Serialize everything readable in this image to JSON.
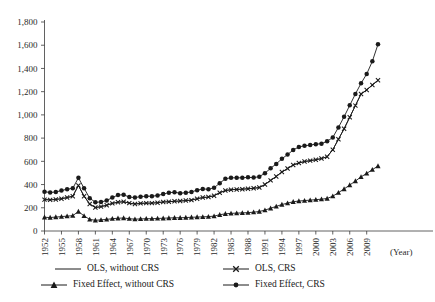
{
  "chart_data": {
    "type": "line",
    "title": "",
    "xlabel": "(Year)",
    "ylabel": "",
    "ylim": [
      0,
      1800
    ],
    "ytick_step": 200,
    "grid": false,
    "legend_position": "bottom",
    "xlabel_suffix": "(Year)",
    "ytick_labels": [
      "0",
      "200",
      "400",
      "600",
      "800",
      "1,000",
      "1,200",
      "1,400",
      "1,600",
      "1,800"
    ],
    "ytick_values": [
      0,
      200,
      400,
      600,
      800,
      1000,
      1200,
      1400,
      1600,
      1800
    ],
    "xtick_labels": [
      "1952",
      "1955",
      "1958",
      "1961",
      "1964",
      "1967",
      "1970",
      "1973",
      "1976",
      "1979",
      "1982",
      "1985",
      "1988",
      "1991",
      "1994",
      "1997",
      "2000",
      "2003",
      "2006",
      "2009"
    ],
    "xtick_values": [
      1952,
      1955,
      1958,
      1961,
      1964,
      1967,
      1970,
      1973,
      1976,
      1979,
      1982,
      1985,
      1988,
      1991,
      1994,
      1997,
      2000,
      2003,
      2006,
      2009
    ],
    "x": [
      1952,
      1953,
      1954,
      1955,
      1956,
      1957,
      1958,
      1959,
      1960,
      1961,
      1962,
      1963,
      1964,
      1965,
      1966,
      1967,
      1968,
      1969,
      1970,
      1971,
      1972,
      1973,
      1974,
      1975,
      1976,
      1977,
      1978,
      1979,
      1980,
      1981,
      1982,
      1983,
      1984,
      1985,
      1986,
      1987,
      1988,
      1989,
      1990,
      1991,
      1992,
      1993,
      1994,
      1995,
      1996,
      1997,
      1998,
      1999,
      2000,
      2001,
      2002,
      2003,
      2004,
      2005,
      2006,
      2007,
      2008,
      2009,
      2010,
      2011
    ],
    "series": [
      {
        "name": "OLS, without CRS",
        "marker": "none",
        "color": "#1a1a1a",
        "values": [
          270,
          268,
          272,
          278,
          288,
          300,
          392,
          300,
          232,
          202,
          210,
          222,
          238,
          248,
          252,
          240,
          232,
          238,
          240,
          240,
          244,
          250,
          252,
          256,
          258,
          262,
          266,
          278,
          288,
          292,
          304,
          330,
          348,
          356,
          358,
          360,
          364,
          368,
          374,
          400,
          436,
          470,
          508,
          538,
          568,
          586,
          598,
          606,
          614,
          624,
          640,
          700,
          790,
          880,
          980,
          1080,
          1180,
          1215,
          1258,
          1298
        ]
      },
      {
        "name": "OLS, CRS",
        "marker": "x",
        "color": "#1a1a1a",
        "values": [
          270,
          268,
          272,
          278,
          288,
          300,
          392,
          300,
          232,
          202,
          210,
          222,
          238,
          248,
          252,
          240,
          232,
          238,
          240,
          240,
          244,
          250,
          252,
          256,
          258,
          262,
          266,
          278,
          288,
          292,
          304,
          330,
          348,
          356,
          358,
          360,
          364,
          368,
          374,
          400,
          436,
          470,
          508,
          538,
          568,
          586,
          598,
          606,
          614,
          624,
          640,
          700,
          790,
          880,
          980,
          1080,
          1180,
          1215,
          1258,
          1298
        ]
      },
      {
        "name": "Fixed Effect, without CRS",
        "marker": "triangle",
        "color": "#1a1a1a",
        "values": [
          118,
          116,
          120,
          124,
          128,
          132,
          168,
          130,
          100,
          92,
          96,
          100,
          106,
          110,
          112,
          106,
          102,
          104,
          106,
          106,
          108,
          110,
          112,
          114,
          114,
          116,
          118,
          120,
          122,
          124,
          128,
          140,
          148,
          152,
          154,
          156,
          158,
          162,
          168,
          180,
          196,
          212,
          228,
          240,
          252,
          258,
          262,
          266,
          270,
          274,
          280,
          300,
          330,
          362,
          396,
          430,
          466,
          496,
          528,
          560
        ]
      },
      {
        "name": "Fixed Effect, CRS",
        "marker": "circle",
        "color": "#1a1a1a",
        "values": [
          338,
          332,
          336,
          348,
          360,
          368,
          458,
          368,
          282,
          248,
          250,
          262,
          288,
          310,
          312,
          292,
          288,
          296,
          300,
          300,
          306,
          318,
          330,
          334,
          326,
          330,
          336,
          352,
          362,
          360,
          372,
          412,
          450,
          458,
          458,
          458,
          462,
          460,
          468,
          498,
          540,
          578,
          622,
          658,
          698,
          724,
          734,
          740,
          748,
          752,
          772,
          806,
          892,
          984,
          1082,
          1180,
          1272,
          1352,
          1462,
          1608
        ]
      }
    ]
  },
  "legend": {
    "items": [
      {
        "label": "OLS, without CRS",
        "marker": "none"
      },
      {
        "label": "OLS, CRS",
        "marker": "x"
      },
      {
        "label": "Fixed Effect, without CRS",
        "marker": "triangle"
      },
      {
        "label": "Fixed Effect, CRS",
        "marker": "circle"
      }
    ]
  },
  "axis": {
    "x_unit_label": "(Year)"
  }
}
